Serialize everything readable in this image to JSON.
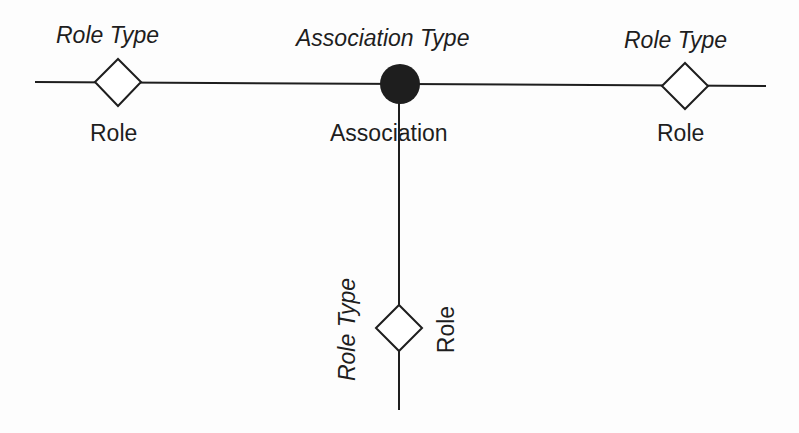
{
  "diagram": {
    "association": {
      "type_label": "Association Type",
      "label": "Association"
    },
    "roles": [
      {
        "type_label": "Role Type",
        "label": "Role",
        "position": "left"
      },
      {
        "type_label": "Role Type",
        "label": "Role",
        "position": "right"
      },
      {
        "type_label": "Role Type",
        "label": "Role",
        "position": "bottom"
      }
    ],
    "colors": {
      "line": "#1e1e1e",
      "association_node": "#1e1e1e",
      "role_node_fill": "#ffffff",
      "background": "#fdfdfd"
    }
  }
}
